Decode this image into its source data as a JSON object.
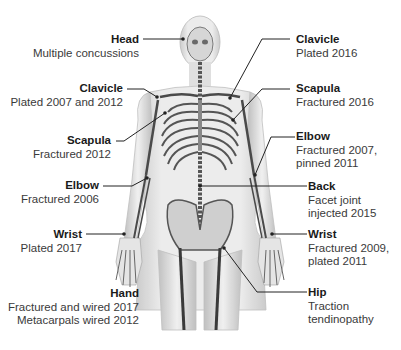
{
  "diagram": {
    "annotations": [
      {
        "id": "head",
        "title": "Head",
        "desc": [
          "Multiple concussions"
        ],
        "side": "left"
      },
      {
        "id": "clavicle-left",
        "title": "Clavicle",
        "desc": [
          "Plated 2007 and 2012"
        ],
        "side": "left"
      },
      {
        "id": "scapula-left",
        "title": "Scapula",
        "desc": [
          "Fractured 2012"
        ],
        "side": "left"
      },
      {
        "id": "elbow-left",
        "title": "Elbow",
        "desc": [
          "Fractured 2006"
        ],
        "side": "left"
      },
      {
        "id": "wrist-left",
        "title": "Wrist",
        "desc": [
          "Plated 2017"
        ],
        "side": "left"
      },
      {
        "id": "hand",
        "title": "Hand",
        "desc": [
          "Fractured and wired 2017",
          "Metacarpals wired 2012"
        ],
        "side": "left"
      },
      {
        "id": "clavicle-right",
        "title": "Clavicle",
        "desc": [
          "Plated 2016"
        ],
        "side": "right"
      },
      {
        "id": "scapula-right",
        "title": "Scapula",
        "desc": [
          "Fractured 2016"
        ],
        "side": "right"
      },
      {
        "id": "elbow-right",
        "title": "Elbow",
        "desc": [
          "Fractured 2007,",
          "pinned 2011"
        ],
        "side": "right"
      },
      {
        "id": "back",
        "title": "Back",
        "desc": [
          "Facet joint",
          "injected 2015"
        ],
        "side": "right"
      },
      {
        "id": "wrist-right",
        "title": "Wrist",
        "desc": [
          "Fractured 2009,",
          "plated 2011"
        ],
        "side": "right"
      },
      {
        "id": "hip",
        "title": "Hip",
        "desc": [
          "Traction",
          "tendinopathy"
        ],
        "side": "right"
      }
    ]
  }
}
